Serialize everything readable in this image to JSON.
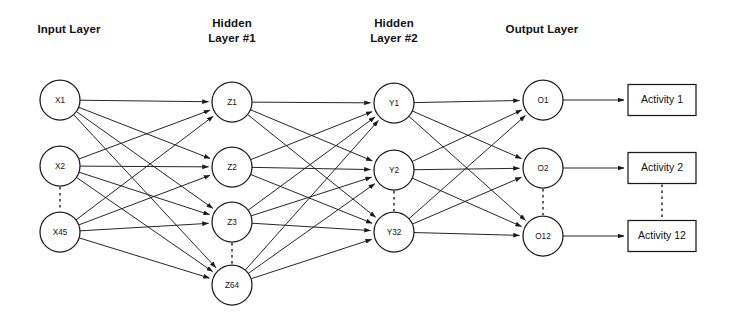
{
  "diagram": {
    "background_color": "#ffffff",
    "stroke_color": "#1a1a1a",
    "headers": [
      {
        "id": "input-layer",
        "lines": [
          "Input Layer"
        ],
        "x": 69,
        "y": 33
      },
      {
        "id": "hidden-layer-1",
        "lines": [
          "Hidden",
          "Layer #1"
        ],
        "x": 232,
        "y": 27
      },
      {
        "id": "hidden-layer-2",
        "lines": [
          "Hidden",
          "Layer #2"
        ],
        "x": 394,
        "y": 27
      },
      {
        "id": "output-layer",
        "lines": [
          "Output Layer"
        ],
        "x": 542,
        "y": 33
      }
    ],
    "layers": [
      {
        "id": "input",
        "name": "Input Layer",
        "x": 60,
        "node_radius": 20,
        "nodes": [
          {
            "id": "x1",
            "label": "X1",
            "y": 100
          },
          {
            "id": "x2",
            "label": "X2",
            "y": 166
          },
          {
            "id": "x45",
            "label": "X45",
            "y": 232
          }
        ],
        "ellipsis_between": [
          {
            "after": "x2",
            "before": "x45"
          }
        ]
      },
      {
        "id": "hidden1",
        "name": "Hidden Layer #1",
        "x": 232,
        "node_radius": 20,
        "nodes": [
          {
            "id": "z1",
            "label": "Z1",
            "y": 102
          },
          {
            "id": "z2",
            "label": "Z2",
            "y": 167
          },
          {
            "id": "z3",
            "label": "Z3",
            "y": 222
          },
          {
            "id": "z64",
            "label": "Z64",
            "y": 285
          }
        ],
        "ellipsis_between": [
          {
            "after": "z3",
            "before": "z64"
          }
        ]
      },
      {
        "id": "hidden2",
        "name": "Hidden Layer #2",
        "x": 394,
        "node_radius": 20,
        "nodes": [
          {
            "id": "y1",
            "label": "Y1",
            "y": 103
          },
          {
            "id": "y2",
            "label": "Y2",
            "y": 170
          },
          {
            "id": "y32",
            "label": "Y32",
            "y": 232
          }
        ],
        "ellipsis_between": [
          {
            "after": "y2",
            "before": "y32"
          }
        ]
      },
      {
        "id": "output",
        "name": "Output Layer",
        "x": 543,
        "node_radius": 20,
        "nodes": [
          {
            "id": "o1",
            "label": "O1",
            "y": 100
          },
          {
            "id": "o2",
            "label": "O2",
            "y": 168
          },
          {
            "id": "o12",
            "label": "O12",
            "y": 236
          }
        ],
        "ellipsis_between": [
          {
            "after": "o2",
            "before": "o12"
          }
        ]
      }
    ],
    "output_boxes": {
      "x": 628,
      "width": 68,
      "height": 31,
      "items": [
        {
          "id": "activity-1",
          "label": "Activity 1",
          "cy": 100,
          "from_node": "o1"
        },
        {
          "id": "activity-2",
          "label": "Activity 2",
          "cy": 168,
          "from_node": "o2"
        },
        {
          "id": "activity-12",
          "label": "Activity 12",
          "cy": 236,
          "from_node": "o12"
        }
      ],
      "ellipsis_between": [
        {
          "after": "activity-2",
          "before": "activity-12"
        }
      ]
    },
    "connections": [
      {
        "from_layer": "input",
        "to_layer": "hidden1",
        "pattern": "fully-connected"
      },
      {
        "from_layer": "hidden1",
        "to_layer": "hidden2",
        "pattern": "fully-connected"
      },
      {
        "from_layer": "hidden2",
        "to_layer": "output",
        "pattern": "fully-connected"
      }
    ]
  }
}
